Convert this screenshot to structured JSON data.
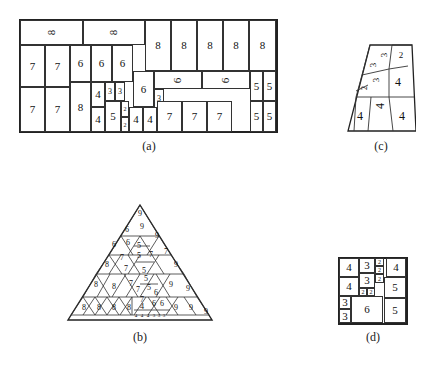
{
  "figure": {
    "background_color": "#ffffff",
    "line_color": "#333333",
    "text_color": "#111111"
  },
  "captions": {
    "a": "(a)",
    "b": "(b)",
    "c": "(c)",
    "d": "(d)"
  },
  "panel_a": {
    "name": "rectangle-packing",
    "shape": "rectangle",
    "cells": [
      {
        "label": "8",
        "x": 1,
        "y": 1,
        "w": 63,
        "h": 25,
        "rot": true,
        "size": "normal"
      },
      {
        "label": "8",
        "x": 64,
        "y": 1,
        "w": 62,
        "h": 25,
        "rot": true,
        "size": "normal"
      },
      {
        "label": "8",
        "x": 126,
        "y": 1,
        "w": 26,
        "h": 51,
        "rot": false,
        "size": "normal"
      },
      {
        "label": "8",
        "x": 152,
        "y": 1,
        "w": 26,
        "h": 51,
        "rot": false,
        "size": "normal"
      },
      {
        "label": "8",
        "x": 178,
        "y": 1,
        "w": 26,
        "h": 51,
        "rot": false,
        "size": "normal"
      },
      {
        "label": "8",
        "x": 204,
        "y": 1,
        "w": 26,
        "h": 51,
        "rot": false,
        "size": "normal"
      },
      {
        "label": "8",
        "x": 230,
        "y": 1,
        "w": 27,
        "h": 51,
        "rot": false,
        "size": "normal"
      },
      {
        "label": "7",
        "x": 1,
        "y": 26,
        "w": 25,
        "h": 42,
        "rot": false,
        "size": "normal"
      },
      {
        "label": "7",
        "x": 26,
        "y": 26,
        "w": 25,
        "h": 42,
        "rot": false,
        "size": "normal"
      },
      {
        "label": "6",
        "x": 51,
        "y": 26,
        "w": 21,
        "h": 37,
        "rot": false,
        "size": "normal"
      },
      {
        "label": "6",
        "x": 72,
        "y": 26,
        "w": 21,
        "h": 37,
        "rot": false,
        "size": "normal"
      },
      {
        "label": "6",
        "x": 93,
        "y": 26,
        "w": 21,
        "h": 37,
        "rot": false,
        "size": "normal"
      },
      {
        "label": "6",
        "x": 114,
        "y": 52,
        "w": 21,
        "h": 36,
        "rot": false,
        "size": "normal"
      },
      {
        "label": "6",
        "x": 135,
        "y": 52,
        "w": 48,
        "h": 18,
        "rot": true,
        "size": "normal"
      },
      {
        "label": "6",
        "x": 183,
        "y": 52,
        "w": 48,
        "h": 18,
        "rot": true,
        "size": "normal"
      },
      {
        "label": "5",
        "x": 231,
        "y": 52,
        "w": 13,
        "h": 30,
        "rot": false,
        "size": "normal"
      },
      {
        "label": "5",
        "x": 244,
        "y": 52,
        "w": 13,
        "h": 30,
        "rot": false,
        "size": "normal"
      },
      {
        "label": "4",
        "x": 72,
        "y": 63,
        "w": 14,
        "h": 25,
        "rot": false,
        "size": "normal"
      },
      {
        "label": "3",
        "x": 86,
        "y": 63,
        "w": 10,
        "h": 19,
        "rot": false,
        "size": "small"
      },
      {
        "label": "3",
        "x": 96,
        "y": 63,
        "w": 10,
        "h": 19,
        "rot": false,
        "size": "small"
      },
      {
        "label": "3",
        "x": 135,
        "y": 70,
        "w": 10,
        "h": 19,
        "rot": false,
        "size": "small"
      },
      {
        "label": "7",
        "x": 1,
        "y": 68,
        "w": 25,
        "h": 45,
        "rot": false,
        "size": "normal"
      },
      {
        "label": "7",
        "x": 26,
        "y": 68,
        "w": 25,
        "h": 45,
        "rot": false,
        "size": "normal"
      },
      {
        "label": "8",
        "x": 51,
        "y": 63,
        "w": 21,
        "h": 50,
        "rot": false,
        "size": "normal"
      },
      {
        "label": "4",
        "x": 72,
        "y": 88,
        "w": 14,
        "h": 25,
        "rot": false,
        "size": "normal"
      },
      {
        "label": "5",
        "x": 86,
        "y": 82,
        "w": 16,
        "h": 31,
        "rot": false,
        "size": "normal"
      },
      {
        "label": "2",
        "x": 102,
        "y": 82,
        "w": 8,
        "h": 16,
        "rot": false,
        "size": "tiny"
      },
      {
        "label": "2",
        "x": 102,
        "y": 98,
        "w": 8,
        "h": 15,
        "rot": false,
        "size": "tiny"
      },
      {
        "label": "4",
        "x": 110,
        "y": 88,
        "w": 14,
        "h": 25,
        "rot": false,
        "size": "normal"
      },
      {
        "label": "4",
        "x": 124,
        "y": 88,
        "w": 14,
        "h": 25,
        "rot": false,
        "size": "normal"
      },
      {
        "label": "7",
        "x": 138,
        "y": 82,
        "w": 25,
        "h": 31,
        "rot": false,
        "size": "normal"
      },
      {
        "label": "7",
        "x": 163,
        "y": 82,
        "w": 25,
        "h": 31,
        "rot": false,
        "size": "normal"
      },
      {
        "label": "7",
        "x": 188,
        "y": 82,
        "w": 25,
        "h": 31,
        "rot": false,
        "size": "normal"
      },
      {
        "label": "5",
        "x": 231,
        "y": 82,
        "w": 13,
        "h": 31,
        "rot": false,
        "size": "normal"
      },
      {
        "label": "5",
        "x": 244,
        "y": 82,
        "w": 13,
        "h": 31,
        "rot": false,
        "size": "normal"
      }
    ]
  },
  "panel_b": {
    "name": "triangle-packing",
    "shape": "triangle",
    "labels": [
      {
        "label": "9",
        "x": 74,
        "y": 14,
        "size": 8
      },
      {
        "label": "6",
        "x": 61,
        "y": 30,
        "size": 8
      },
      {
        "label": "9",
        "x": 76,
        "y": 27,
        "size": 8
      },
      {
        "label": "9",
        "x": 91,
        "y": 36,
        "size": 8
      },
      {
        "label": "6",
        "x": 48,
        "y": 45,
        "size": 8
      },
      {
        "label": "6",
        "x": 62,
        "y": 43,
        "size": 8
      },
      {
        "label": "5",
        "x": 73,
        "y": 46,
        "size": 8
      },
      {
        "label": "5",
        "x": 73,
        "y": 56,
        "size": 8
      },
      {
        "label": "7",
        "x": 85,
        "y": 55,
        "size": 8
      },
      {
        "label": "7",
        "x": 100,
        "y": 52,
        "size": 8
      },
      {
        "label": "7",
        "x": 56,
        "y": 58,
        "size": 8
      },
      {
        "label": "8",
        "x": 41,
        "y": 65,
        "size": 8
      },
      {
        "label": "7",
        "x": 60,
        "y": 69,
        "size": 8
      },
      {
        "label": "9",
        "x": 110,
        "y": 65,
        "size": 8
      },
      {
        "label": "5",
        "x": 78,
        "y": 71,
        "size": 8
      },
      {
        "label": "5",
        "x": 80,
        "y": 79,
        "size": 8
      },
      {
        "label": "8",
        "x": 30,
        "y": 85,
        "size": 8
      },
      {
        "label": "8",
        "x": 48,
        "y": 87,
        "size": 8
      },
      {
        "label": "7",
        "x": 65,
        "y": 84,
        "size": 8
      },
      {
        "label": "7",
        "x": 72,
        "y": 90,
        "size": 8
      },
      {
        "label": "5",
        "x": 83,
        "y": 88,
        "size": 8
      },
      {
        "label": "6",
        "x": 90,
        "y": 93,
        "size": 8
      },
      {
        "label": "9",
        "x": 105,
        "y": 85,
        "size": 8
      },
      {
        "label": "9",
        "x": 122,
        "y": 89,
        "size": 8
      },
      {
        "label": "7",
        "x": 76,
        "y": 100,
        "size": 8
      },
      {
        "label": "6",
        "x": 88,
        "y": 104,
        "size": 8
      },
      {
        "label": "6",
        "x": 96,
        "y": 104,
        "size": 8
      },
      {
        "label": "8",
        "x": 18,
        "y": 108,
        "size": 8
      },
      {
        "label": "8",
        "x": 33,
        "y": 108,
        "size": 8
      },
      {
        "label": "8",
        "x": 48,
        "y": 108,
        "size": 8
      },
      {
        "label": "8",
        "x": 63,
        "y": 108,
        "size": 8
      },
      {
        "label": "4",
        "x": 76,
        "y": 107,
        "size": 8
      },
      {
        "label": "9",
        "x": 110,
        "y": 108,
        "size": 8
      },
      {
        "label": "9",
        "x": 125,
        "y": 108,
        "size": 8
      },
      {
        "label": "9",
        "x": 140,
        "y": 112,
        "size": 8
      },
      {
        "label": "4",
        "x": 70,
        "y": 116,
        "size": 5
      },
      {
        "label": "4",
        "x": 76,
        "y": 116,
        "size": 5
      },
      {
        "label": "4",
        "x": 82,
        "y": 116,
        "size": 5
      },
      {
        "label": "3",
        "x": 88,
        "y": 116,
        "size": 5
      },
      {
        "label": "3",
        "x": 93,
        "y": 116,
        "size": 5
      },
      {
        "label": "3",
        "x": 98,
        "y": 116,
        "size": 5
      }
    ]
  },
  "panel_c": {
    "name": "trapezoid-packing",
    "shape": "trapezoid",
    "labels": [
      {
        "label": "3",
        "x": 39,
        "y": 14,
        "size": 9,
        "rot": true
      },
      {
        "label": "2",
        "x": 55,
        "y": 15,
        "size": 9,
        "rot": false
      },
      {
        "label": "3",
        "x": 28,
        "y": 24,
        "size": 9,
        "rot": true
      },
      {
        "label": "3",
        "x": 31,
        "y": 39,
        "size": 9,
        "rot": true
      },
      {
        "label": "4",
        "x": 52,
        "y": 42,
        "size": 12,
        "rot": false
      },
      {
        "label": "2",
        "x": 19,
        "y": 47,
        "size": 8,
        "rot": true
      },
      {
        "label": "4",
        "x": 35,
        "y": 65,
        "size": 12,
        "rot": true
      },
      {
        "label": "4",
        "x": 14,
        "y": 76,
        "size": 12,
        "rot": false
      },
      {
        "label": "4",
        "x": 56,
        "y": 76,
        "size": 12,
        "rot": false
      }
    ]
  },
  "panel_d": {
    "name": "square-packing",
    "shape": "square",
    "cells": [
      {
        "label": "4",
        "x": 1,
        "y": 1,
        "w": 20,
        "h": 19,
        "size": "normal"
      },
      {
        "label": "3",
        "x": 21,
        "y": 1,
        "w": 16,
        "h": 15,
        "size": "normal"
      },
      {
        "label": "2",
        "x": 37,
        "y": 1,
        "w": 9,
        "h": 8,
        "size": "tiny"
      },
      {
        "label": "2",
        "x": 37,
        "y": 9,
        "w": 9,
        "h": 8,
        "size": "tiny"
      },
      {
        "label": "4",
        "x": 48,
        "y": 1,
        "w": 20,
        "h": 19,
        "size": "normal"
      },
      {
        "label": "4",
        "x": 1,
        "y": 20,
        "w": 20,
        "h": 19,
        "size": "normal"
      },
      {
        "label": "3",
        "x": 21,
        "y": 16,
        "w": 16,
        "h": 15,
        "size": "normal"
      },
      {
        "label": "2",
        "x": 37,
        "y": 17,
        "w": 9,
        "h": 9,
        "size": "tiny"
      },
      {
        "label": "2",
        "x": 21,
        "y": 31,
        "w": 8,
        "h": 8,
        "size": "tiny"
      },
      {
        "label": "2",
        "x": 29,
        "y": 31,
        "w": 8,
        "h": 8,
        "size": "tiny"
      },
      {
        "label": "5",
        "x": 46,
        "y": 20,
        "w": 22,
        "h": 21,
        "size": "normal"
      },
      {
        "label": "3",
        "x": 1,
        "y": 39,
        "w": 12,
        "h": 13,
        "size": "normal"
      },
      {
        "label": "3",
        "x": 1,
        "y": 52,
        "w": 12,
        "h": 14,
        "size": "normal"
      },
      {
        "label": "6",
        "x": 13,
        "y": 39,
        "w": 32,
        "h": 27,
        "size": "normal"
      },
      {
        "label": "5",
        "x": 46,
        "y": 41,
        "w": 22,
        "h": 25,
        "size": "normal"
      }
    ]
  }
}
